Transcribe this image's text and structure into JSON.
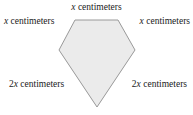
{
  "figure": {
    "shape_name": "pentagon",
    "fill_color": "#ebebeb",
    "stroke_color": "#999999",
    "background_color": "#ffffff",
    "text_color": "#1a1a1a",
    "vertices": [
      {
        "x": 75,
        "y": 20
      },
      {
        "x": 118,
        "y": 20
      },
      {
        "x": 135,
        "y": 50
      },
      {
        "x": 97,
        "y": 107
      },
      {
        "x": 59,
        "y": 50
      }
    ],
    "points_attr": "75,20 118,20 135,50 97,107 59,50"
  },
  "labels": {
    "top": {
      "coefficient": "",
      "variable": "x",
      "unit": " centimeters"
    },
    "left": {
      "coefficient": "",
      "variable": "x",
      "unit": " centimeters"
    },
    "right": {
      "coefficient": "",
      "variable": "x",
      "unit": " centimeters"
    },
    "bottom_left": {
      "coefficient": "2",
      "variable": "x",
      "unit": " centimeters"
    },
    "bottom_right": {
      "coefficient": "2",
      "variable": "x",
      "unit": " centimeters"
    }
  }
}
